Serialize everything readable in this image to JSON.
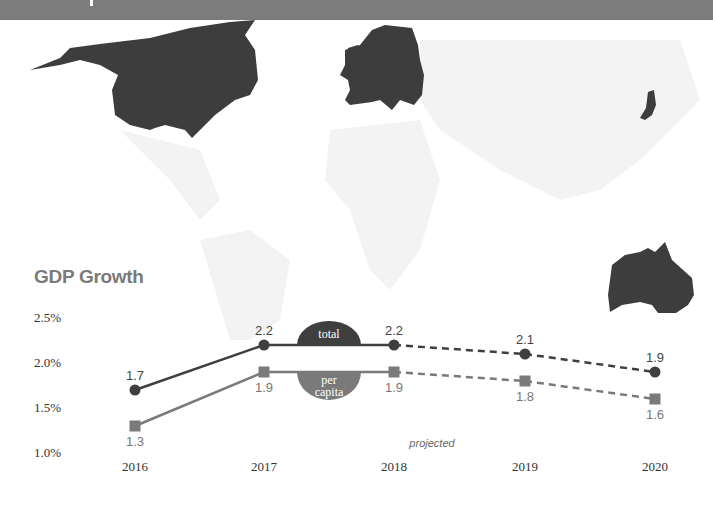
{
  "header": {
    "color": "#7c7c7c"
  },
  "map": {
    "highlighted_regions": [
      "North America",
      "Europe",
      "Japan",
      "Australia"
    ],
    "highlight_color": "#3d3d3d",
    "base_color": "#f2f2f2"
  },
  "chart_data": {
    "type": "line",
    "title": "GDP Growth",
    "xlabel": "",
    "ylabel": "",
    "x": [
      "2016",
      "2017",
      "2018",
      "2019",
      "2020"
    ],
    "yticks": [
      "2.5%",
      "2.0%",
      "1.5%",
      "1.0%"
    ],
    "ytick_values": [
      2.5,
      2.0,
      1.5,
      1.0
    ],
    "ylim": [
      1.0,
      2.5
    ],
    "grid": false,
    "projected_from_index": 2,
    "projected_label": "projected",
    "series": [
      {
        "name": "total",
        "badge_label": [
          "total"
        ],
        "marker": "circle",
        "color": "#3f3f3f",
        "values": [
          1.7,
          2.2,
          2.2,
          2.1,
          1.9
        ],
        "labels": [
          "1.7",
          "2.2",
          "2.2",
          "2.1",
          "1.9"
        ]
      },
      {
        "name": "per capita",
        "badge_label": [
          "per",
          "capita"
        ],
        "marker": "square",
        "color": "#7a7a7a",
        "values": [
          1.3,
          1.9,
          1.9,
          1.8,
          1.6
        ],
        "labels": [
          "1.3",
          "1.9",
          "1.9",
          "1.8",
          "1.6"
        ]
      }
    ]
  }
}
